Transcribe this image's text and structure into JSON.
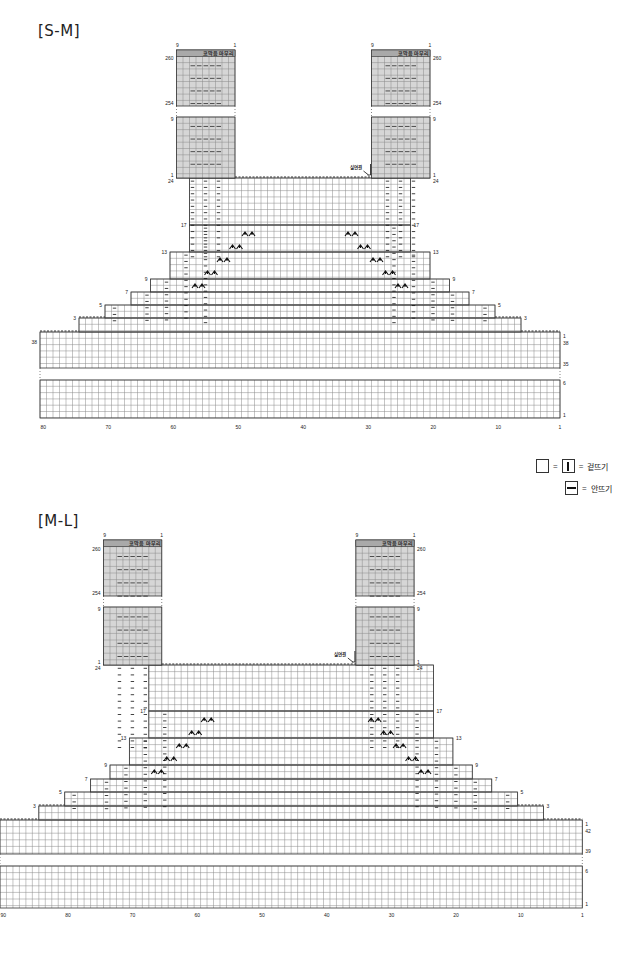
{
  "legend": {
    "knit_label": "겉뜨기",
    "purl_label": "안뜨기",
    "equals": "="
  },
  "colors": {
    "grid": "#8a8a8a",
    "outline": "#333333",
    "strap_shade": "#d6d6d6",
    "header_shade": "#a9a9a9",
    "symbol": "#111111"
  },
  "charts": [
    {
      "id": "sm",
      "title": "[S-M]",
      "title_pos": [
        38,
        22
      ],
      "cols": 80,
      "x0": 40,
      "cell_w": 6.5,
      "cell_h": 6.3,
      "body_top_row_y": 332,
      "body_bottom_y": 368,
      "gap_bottom_y": 380,
      "bottom_block_bottom_y": 418,
      "col_label_y": 429,
      "col_labels": [
        "80",
        "70",
        "60",
        "50",
        "40",
        "30",
        "20",
        "10",
        "1"
      ],
      "row_labels_left": [
        {
          "text": "38",
          "y": 344
        }
      ],
      "row_labels_right": [
        {
          "text": "1",
          "y": 338
        },
        {
          "text": "38",
          "y": 345
        },
        {
          "text": "35",
          "y": 366
        },
        {
          "text": "6",
          "y": 385
        },
        {
          "text": "1",
          "y": 417
        }
      ],
      "strap_left_col": 51,
      "strap_right_col": 21,
      "strap_top_y": 117,
      "strap_bottom_y": 178,
      "upper_top_y": 50,
      "upper_bottom_y": 106,
      "neck_y": 178,
      "strap_labels": {
        "header": "코막음 마무리",
        "col_left": "9",
        "col_right": "1",
        "r260": "260",
        "r254": "254",
        "r9": "9",
        "r1": "1",
        "r24": "24"
      },
      "yarn_join_label": "실연결",
      "steps": [
        {
          "label": "17",
          "y": 227
        },
        {
          "label": "13",
          "y": 254
        },
        {
          "label": "9",
          "y": 281
        },
        {
          "label": "7",
          "y": 294
        },
        {
          "label": "5",
          "y": 307
        },
        {
          "label": "3",
          "y": 320
        }
      ]
    },
    {
      "id": "ml",
      "title": "[M-L]",
      "title_pos": [
        38,
        512
      ],
      "cols": 90,
      "x0": 0,
      "cell_w": 6.47,
      "cell_h": 6.6,
      "body_top_row_y": 820,
      "body_bottom_y": 854,
      "gap_bottom_y": 866,
      "bottom_block_bottom_y": 908,
      "col_label_y": 917,
      "col_labels": [
        "90",
        "80",
        "70",
        "60",
        "50",
        "40",
        "30",
        "20",
        "10",
        "1"
      ],
      "row_labels_left": [],
      "row_labels_right": [
        {
          "text": "1",
          "y": 826
        },
        {
          "text": "42",
          "y": 833
        },
        {
          "text": "39",
          "y": 853
        },
        {
          "text": "6",
          "y": 873
        },
        {
          "text": "1",
          "y": 906
        }
      ],
      "strap_left_col": 66,
      "strap_right_col": 27,
      "strap_top_y": 607,
      "strap_bottom_y": 665,
      "upper_top_y": 540,
      "upper_bottom_y": 596,
      "neck_y": 665,
      "strap_labels": {
        "header": "코막음 마무리",
        "col_left": "9",
        "col_right": "1",
        "r260": "260",
        "r254": "254",
        "r9": "9",
        "r1": "1",
        "r24": "24"
      },
      "yarn_join_label": "실연결",
      "steps": [
        {
          "label": "17",
          "y": 713
        },
        {
          "label": "13",
          "y": 740
        },
        {
          "label": "9",
          "y": 767
        },
        {
          "label": "7",
          "y": 781
        },
        {
          "label": "5",
          "y": 794
        },
        {
          "label": "3",
          "y": 808
        }
      ]
    }
  ]
}
